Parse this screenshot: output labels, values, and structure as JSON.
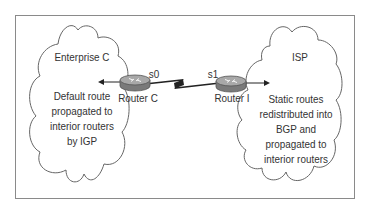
{
  "diagram": {
    "type": "network-topology",
    "colors": {
      "frame": "#8a8a8a",
      "cloud_stroke": "#666666",
      "text": "#333333",
      "router_top": "#9a9a9a",
      "router_side": "#777777",
      "link": "#222222"
    },
    "clouds": [
      {
        "id": "enterprise-c",
        "title": "Enterprise C",
        "description_lines": [
          "Default route",
          "propagated to",
          "interior routers",
          "by IGP"
        ]
      },
      {
        "id": "isp",
        "title": "ISP",
        "description_lines": [
          "Static routes",
          "redistributed into",
          "BGP and",
          "propagated to",
          "interior routers"
        ]
      }
    ],
    "routers": [
      {
        "id": "router-c",
        "label": "Router C",
        "interface": "s0",
        "icon": "router-icon"
      },
      {
        "id": "router-i",
        "label": "Router I",
        "interface": "s1",
        "icon": "router-icon"
      }
    ],
    "links": [
      {
        "from": "router-c",
        "to": "router-i",
        "style": "serial-lightning"
      }
    ],
    "arrows": [
      {
        "from": "router-c",
        "direction": "left",
        "meaning": "default route into Enterprise C"
      },
      {
        "from": "router-i",
        "direction": "right",
        "meaning": "routes into ISP"
      }
    ]
  }
}
